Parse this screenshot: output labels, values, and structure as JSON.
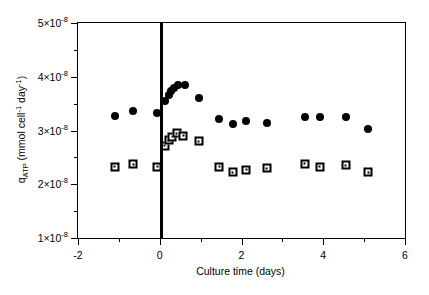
{
  "chart_data": {
    "type": "scatter",
    "title": "",
    "xlabel": "Culture time (days)",
    "ylabel": "q_ATP (mmol cell^-1 day^-1)",
    "ylabel_parts": {
      "q": "q",
      "sub": "ATP",
      "units": " (mmol cell",
      "sup1": "-1",
      "mid": " day",
      "sup2": "-1",
      "close": ")"
    },
    "xlim": [
      -2,
      6
    ],
    "ylim": [
      1e-08,
      5e-08
    ],
    "xticks": [
      -2,
      0,
      2,
      4,
      6
    ],
    "xtick_labels": [
      "-2",
      "0",
      "2",
      "4",
      "6"
    ],
    "xticks_minor": [
      -1,
      1,
      3,
      5
    ],
    "yticks": [
      1e-08,
      2e-08,
      3e-08,
      4e-08,
      5e-08
    ],
    "ytick_labels": [
      "1×10",
      "2×10",
      "3×10",
      "4×10",
      "5×10"
    ],
    "ytick_exponent": "-8",
    "yticks_minor": [
      1.5e-08,
      2.5e-08,
      3.5e-08,
      4.5e-08
    ],
    "grid": false,
    "legend": "none",
    "annotations": [
      {
        "name": "inoculation-divider",
        "type": "vline",
        "x": 0,
        "linewidth": 3,
        "color": "#000000"
      }
    ],
    "series": [
      {
        "name": "filled-circle-series",
        "marker": "filled-circle",
        "color": "#000000",
        "points": [
          {
            "x": -1.1,
            "y": 3.27e-08
          },
          {
            "x": -0.65,
            "y": 3.37e-08
          },
          {
            "x": -0.06,
            "y": 3.32e-08
          },
          {
            "x": 0.12,
            "y": 3.55e-08
          },
          {
            "x": 0.22,
            "y": 3.66e-08
          },
          {
            "x": 0.28,
            "y": 3.74e-08
          },
          {
            "x": 0.34,
            "y": 3.8e-08
          },
          {
            "x": 0.44,
            "y": 3.85e-08
          },
          {
            "x": 0.62,
            "y": 3.84e-08
          },
          {
            "x": 0.95,
            "y": 3.6e-08
          },
          {
            "x": 1.45,
            "y": 3.22e-08
          },
          {
            "x": 1.78,
            "y": 3.12e-08
          },
          {
            "x": 2.12,
            "y": 3.18e-08
          },
          {
            "x": 2.62,
            "y": 3.14e-08
          },
          {
            "x": 3.55,
            "y": 3.25e-08
          },
          {
            "x": 3.92,
            "y": 3.25e-08
          },
          {
            "x": 4.55,
            "y": 3.25e-08
          },
          {
            "x": 5.1,
            "y": 3.03e-08
          }
        ]
      },
      {
        "name": "open-square-series",
        "marker": "open-square",
        "color": "#000000",
        "points": [
          {
            "x": -1.1,
            "y": 2.33e-08
          },
          {
            "x": -0.65,
            "y": 2.37e-08
          },
          {
            "x": -0.06,
            "y": 2.33e-08
          },
          {
            "x": 0.12,
            "y": 2.72e-08
          },
          {
            "x": 0.22,
            "y": 2.82e-08
          },
          {
            "x": 0.3,
            "y": 2.88e-08
          },
          {
            "x": 0.42,
            "y": 2.95e-08
          },
          {
            "x": 0.58,
            "y": 2.9e-08
          },
          {
            "x": 0.95,
            "y": 2.8e-08
          },
          {
            "x": 1.45,
            "y": 2.33e-08
          },
          {
            "x": 1.78,
            "y": 2.22e-08
          },
          {
            "x": 2.12,
            "y": 2.27e-08
          },
          {
            "x": 2.62,
            "y": 2.3e-08
          },
          {
            "x": 3.55,
            "y": 2.38e-08
          },
          {
            "x": 3.92,
            "y": 2.33e-08
          },
          {
            "x": 4.55,
            "y": 2.35e-08
          },
          {
            "x": 5.1,
            "y": 2.22e-08
          }
        ]
      }
    ]
  }
}
